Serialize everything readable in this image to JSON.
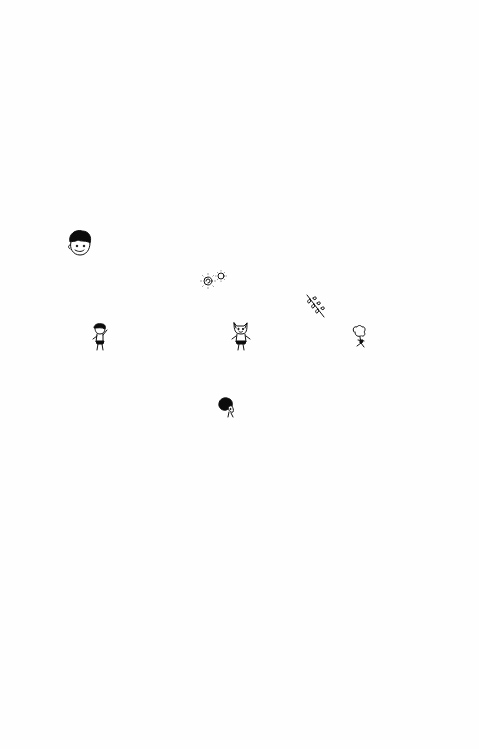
{
  "page": {
    "background": "#fefefe",
    "ink_color": "#111111",
    "doodles": [
      {
        "id": "boy-head",
        "subject": "boy's face with dark hair"
      },
      {
        "id": "two-suns",
        "subject": "two small sun / flower spirals"
      },
      {
        "id": "leafy-sprig",
        "subject": "diagonal leafy branch"
      },
      {
        "id": "running-boy",
        "subject": "small boy with black hair, waving"
      },
      {
        "id": "cat-figure",
        "subject": "cat-eared figure standing"
      },
      {
        "id": "curly-figure",
        "subject": "curly-haired small figure"
      },
      {
        "id": "round-head",
        "subject": "round black-haired head"
      }
    ]
  }
}
